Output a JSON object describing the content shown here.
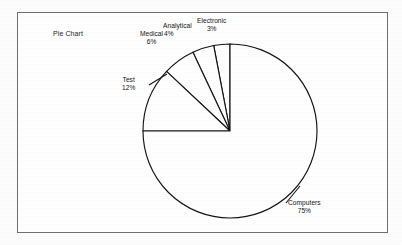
{
  "panel": {
    "title": "Pie Chart",
    "border_color": "#6f6f6f",
    "background_color": "#ffffff"
  },
  "chart_data": {
    "type": "pie",
    "title": "Pie Chart",
    "xlabel": "",
    "ylabel": "",
    "grid": false,
    "legend_position": "none",
    "label_style": "outside-callout",
    "start_angle_deg": 90,
    "direction": "clockwise",
    "center": {
      "x": 230,
      "y": 131
    },
    "radius": 87,
    "stroke_color": "#141414",
    "fill_color": "#ffffff",
    "categories": [
      "Computers",
      "Test",
      "Medical",
      "Analytical",
      "Electronic"
    ],
    "values": [
      75,
      12,
      6,
      4,
      3
    ],
    "slices": [
      {
        "name": "Computers",
        "percent_label": "75%",
        "value": 75,
        "label_name": "Computers",
        "label_pct": "75%"
      },
      {
        "name": "Test",
        "percent_label": "12%",
        "value": 12,
        "label_name": "Test",
        "label_pct": "12%"
      },
      {
        "name": "Medical",
        "percent_label": "6%",
        "value": 6,
        "label_name": "Medical",
        "label_pct": "6%"
      },
      {
        "name": "Analytical",
        "percent_label": "4%",
        "value": 4,
        "label_name": "Analytical",
        "label_pct": "4%"
      },
      {
        "name": "Electronic",
        "percent_label": "3%",
        "value": 3,
        "label_name": "Electronic",
        "label_pct": "3%"
      }
    ]
  }
}
